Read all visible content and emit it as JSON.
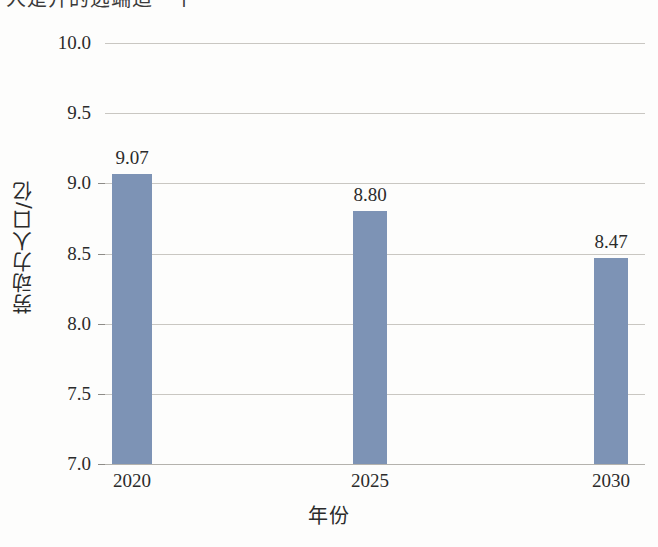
{
  "page": {
    "cropped_heading_fragment": "人是开的远端适一个",
    "background_color": "#fdfdfc"
  },
  "chart_data": {
    "type": "bar",
    "title": "",
    "categories": [
      "2020",
      "2025",
      "2030"
    ],
    "values": [
      9.07,
      8.8,
      8.47
    ],
    "value_labels": [
      "9.07",
      "8.80",
      "8.47"
    ],
    "xlabel": "年份",
    "ylabel": "劳动力人口/亿",
    "ylim": [
      7.0,
      10.0
    ],
    "ytick_labels": [
      "7.0",
      "7.5",
      "8.0",
      "8.5",
      "9.0",
      "9.5",
      "10.0"
    ],
    "ytick_values": [
      7.0,
      7.5,
      8.0,
      8.5,
      9.0,
      9.5,
      10.0
    ],
    "grid": true,
    "grid_axis": "y",
    "legend": false,
    "bar_color": "#7d93b5",
    "grid_color": "#c9c7c2",
    "axis_color": "#b4b2ad",
    "text_color": "#2b2b2b"
  }
}
